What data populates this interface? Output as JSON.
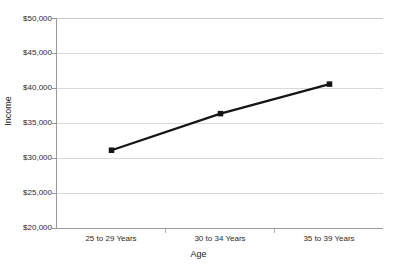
{
  "chart_data": {
    "type": "line",
    "title": "",
    "xlabel": "Age",
    "ylabel": "Income",
    "categories": [
      "25 to 29 Years",
      "30 to 34 Years",
      "35 to 39 Years"
    ],
    "values": [
      31200,
      36400,
      40600
    ],
    "series": [
      {
        "name": "Income",
        "values": [
          31200,
          36400,
          40600
        ]
      }
    ],
    "ylim": [
      20000,
      50000
    ],
    "ytick_values": [
      20000,
      25000,
      30000,
      35000,
      40000,
      45000,
      50000
    ],
    "ytick_labels": [
      "$20,000",
      "$25,000",
      "$30,000",
      "$35,000",
      "$40,000",
      "$45,000",
      "$50,000"
    ],
    "grid": true,
    "legend": "none",
    "marker": "square",
    "line_color": "#151515",
    "marker_color": "#151515",
    "grid_color": "#d9d9d9",
    "axis_color": "#9a9a9a",
    "background": "#ffffff"
  }
}
